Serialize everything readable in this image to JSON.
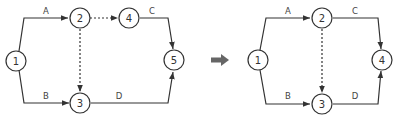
{
  "colors": {
    "line": "#333333",
    "arrow_transform": "#666666",
    "background": "#ffffff"
  },
  "left_diagram": {
    "nodes": [
      {
        "id": "1",
        "label": "1"
      },
      {
        "id": "2",
        "label": "2"
      },
      {
        "id": "3",
        "label": "3"
      },
      {
        "id": "4",
        "label": "4"
      },
      {
        "id": "5",
        "label": "5"
      }
    ],
    "edges": [
      {
        "from": "1",
        "to": "2",
        "label": "A",
        "style": "solid"
      },
      {
        "from": "1",
        "to": "3",
        "label": "B",
        "style": "solid"
      },
      {
        "from": "4",
        "to": "5",
        "label": "C",
        "style": "solid"
      },
      {
        "from": "3",
        "to": "5",
        "label": "D",
        "style": "solid"
      },
      {
        "from": "2",
        "to": "4",
        "label": "",
        "style": "dashed"
      },
      {
        "from": "2",
        "to": "3",
        "label": "",
        "style": "dashed"
      }
    ]
  },
  "transform_arrow": "right-arrow",
  "right_diagram": {
    "nodes": [
      {
        "id": "1",
        "label": "1"
      },
      {
        "id": "2",
        "label": "2"
      },
      {
        "id": "3",
        "label": "3"
      },
      {
        "id": "4",
        "label": "4"
      }
    ],
    "edges": [
      {
        "from": "1",
        "to": "2",
        "label": "A",
        "style": "solid"
      },
      {
        "from": "1",
        "to": "3",
        "label": "B",
        "style": "solid"
      },
      {
        "from": "2",
        "to": "4",
        "label": "C",
        "style": "solid"
      },
      {
        "from": "3",
        "to": "4",
        "label": "D",
        "style": "solid"
      },
      {
        "from": "2",
        "to": "3",
        "label": "",
        "style": "dashed"
      }
    ]
  }
}
